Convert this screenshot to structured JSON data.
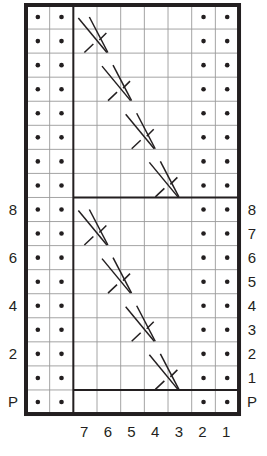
{
  "chart": {
    "columns": 9,
    "rows": 17,
    "grid": {
      "left": 26,
      "top": 5,
      "cell_w": 23.67,
      "cell_h": 24.06
    },
    "colors": {
      "ink": "#231f20",
      "grid": "#9a9a9a",
      "background": "#ffffff"
    },
    "column_labels": [
      {
        "col": 2,
        "text": "7"
      },
      {
        "col": 3,
        "text": "6"
      },
      {
        "col": 4,
        "text": "5"
      },
      {
        "col": 5,
        "text": "4"
      },
      {
        "col": 6,
        "text": "3"
      },
      {
        "col": 7,
        "text": "2"
      },
      {
        "col": 8,
        "text": "1"
      }
    ],
    "left_row_labels": [
      {
        "row": 8,
        "text": "8"
      },
      {
        "row": 10,
        "text": "6"
      },
      {
        "row": 12,
        "text": "4"
      },
      {
        "row": 14,
        "text": "2"
      },
      {
        "row": 16,
        "text": "P"
      }
    ],
    "right_row_labels": [
      {
        "row": 8,
        "text": "8"
      },
      {
        "row": 9,
        "text": "7"
      },
      {
        "row": 10,
        "text": "6"
      },
      {
        "row": 11,
        "text": "5"
      },
      {
        "row": 12,
        "text": "4"
      },
      {
        "row": 13,
        "text": "3"
      },
      {
        "row": 14,
        "text": "2"
      },
      {
        "row": 15,
        "text": "1"
      },
      {
        "row": 16,
        "text": "P"
      }
    ],
    "purl_columns": [
      0,
      1,
      7,
      8
    ],
    "cables": [
      {
        "row": 0,
        "col": 2,
        "type": "right-cross-2x2"
      },
      {
        "row": 2,
        "col": 3,
        "type": "right-cross-2x2"
      },
      {
        "row": 4,
        "col": 4,
        "type": "right-cross-2x2"
      },
      {
        "row": 6,
        "col": 5,
        "type": "right-cross-2x2"
      },
      {
        "row": 8,
        "col": 2,
        "type": "right-cross-2x2"
      },
      {
        "row": 10,
        "col": 3,
        "type": "right-cross-2x2"
      },
      {
        "row": 12,
        "col": 4,
        "type": "right-cross-2x2"
      },
      {
        "row": 14,
        "col": 5,
        "type": "right-cross-2x2"
      }
    ],
    "thick_vertical_after_col": 2,
    "thick_horizontal_after_rows": [
      8,
      16
    ],
    "legend": {
      "purl_symbol": "dot",
      "knit_symbol": "empty square",
      "cable_symbol": "crossed diagonal lines"
    }
  }
}
